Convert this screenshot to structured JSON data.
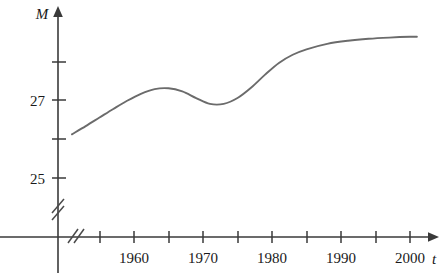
{
  "chart_data": {
    "type": "line",
    "title": "",
    "xlabel": "t",
    "ylabel": "M",
    "grid": false,
    "legend": null,
    "axis_break_x": true,
    "axis_break_y": true,
    "xlim": [
      1951,
      2003
    ],
    "ylim": [
      24.5,
      29.0
    ],
    "x_tick_values": [
      1955,
      1960,
      1965,
      1970,
      1975,
      1980,
      1985,
      1990,
      1995,
      2000
    ],
    "x_tick_labels": [
      "",
      "1960",
      "",
      "1970",
      "",
      "1980",
      "",
      "1990",
      "",
      "2000"
    ],
    "y_tick_values": [
      25,
      26,
      27,
      28
    ],
    "y_tick_labels": [
      "25",
      "",
      "27",
      ""
    ],
    "series": [
      {
        "name": "M",
        "x": [
          1951,
          1953,
          1955,
          1957,
          1959,
          1961,
          1963,
          1965,
          1967,
          1969,
          1971,
          1973,
          1975,
          1977,
          1979,
          1981,
          1983,
          1985,
          1988,
          1991,
          1994,
          1997,
          2000,
          2001
        ],
        "y": [
          26.12,
          26.33,
          26.55,
          26.77,
          26.98,
          27.16,
          27.28,
          27.3,
          27.22,
          27.05,
          26.9,
          26.9,
          27.05,
          27.32,
          27.65,
          27.95,
          28.16,
          28.3,
          28.44,
          28.52,
          28.57,
          28.6,
          28.62,
          28.62
        ]
      }
    ]
  },
  "axis_labels": {
    "y_axis_name": "M",
    "x_axis_name": "t"
  },
  "y_labels": [
    {
      "text": "27",
      "value": 27
    },
    {
      "text": "25",
      "value": 25
    }
  ],
  "x_labels": [
    {
      "text": "1960",
      "value": 1960
    },
    {
      "text": "1970",
      "value": 1970
    },
    {
      "text": "1980",
      "value": 1980
    },
    {
      "text": "1990",
      "value": 1990
    },
    {
      "text": "2000",
      "value": 2000
    }
  ],
  "colors": {
    "axis": "#3a3a3a",
    "curve": "#6b6b6b",
    "text": "#1a1a1a",
    "background": "#ffffff"
  }
}
